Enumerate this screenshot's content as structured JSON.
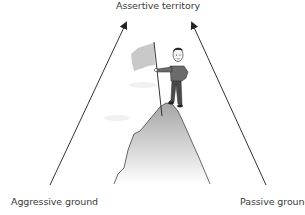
{
  "diagram": {
    "title": "Assertive territory",
    "left_label": "Aggressive ground",
    "right_label": "Passive ground",
    "illustration": "person-holding-flag-on-mountain-peak",
    "arrows": [
      {
        "from": "Aggressive ground",
        "to": "Assertive territory"
      },
      {
        "from": "Passive ground",
        "to": "Assertive territory"
      }
    ]
  },
  "colors": {
    "line": "#333333",
    "flag": "#c8c8c8",
    "mountain_top": "#a9a9a9",
    "mountain_bottom": "#ffffff",
    "shirt": "#6b6b6b",
    "pants": "#4a4a4a"
  }
}
